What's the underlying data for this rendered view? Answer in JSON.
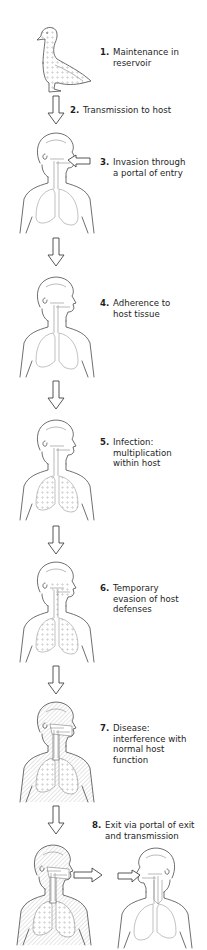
{
  "diagram": {
    "type": "flow",
    "direction": "vertical",
    "steps": [
      {
        "number": "1.",
        "text": "Maintenance in\nreservoir",
        "figure": "duck-reservoir"
      },
      {
        "number": "2.",
        "text": "Transmission to host",
        "figure": "down-arrow"
      },
      {
        "number": "3.",
        "text": "Invasion through\na portal of entry",
        "figure": "human-with-entry-arrow"
      },
      {
        "number": "4.",
        "text": "Adherence to\nhost tissue",
        "figure": "human-clear"
      },
      {
        "number": "5.",
        "text": "Infection:\nmultiplication\nwithin host",
        "figure": "human-dotted-lungs"
      },
      {
        "number": "6.",
        "text": "Temporary\nevasion of host\ndefenses",
        "figure": "human-dotted-respiratory"
      },
      {
        "number": "7.",
        "text": "Disease:\ninterference with\nnormal host\nfunction",
        "figure": "human-hatched-body"
      },
      {
        "number": "8.",
        "text": "Exit via portal of exit\nand transmission",
        "figure": "human-to-new-host"
      }
    ]
  },
  "colors": {
    "line": "#4a4a4a",
    "background": "#ffffff",
    "text": "#1e1e1e"
  }
}
